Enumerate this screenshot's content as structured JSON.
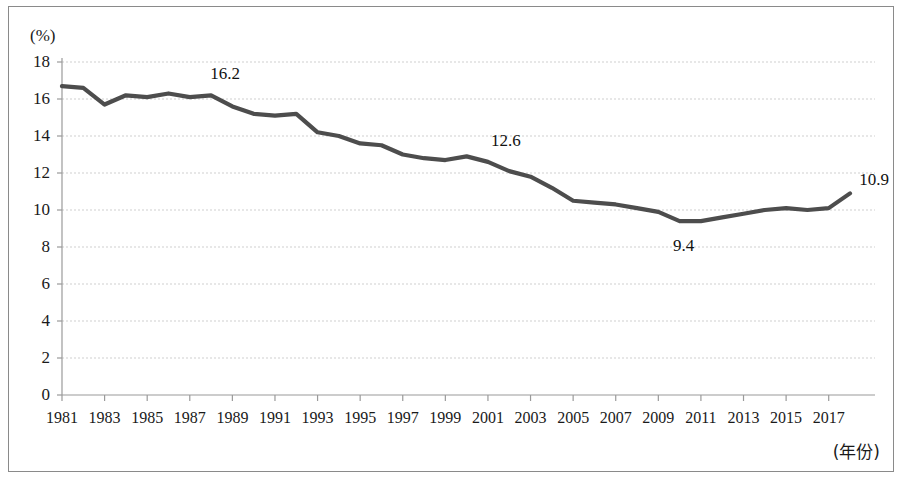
{
  "chart_data": {
    "type": "line",
    "title": "",
    "subtitle": "",
    "xlabel": "(年份)",
    "ylabel": "(%)",
    "ylim": [
      0,
      18
    ],
    "xlim": [
      1981,
      2018
    ],
    "grid": true,
    "legend": false,
    "line_color": "#4d4d4d",
    "x": [
      1981,
      1982,
      1983,
      1984,
      1985,
      1986,
      1987,
      1988,
      1989,
      1990,
      1991,
      1992,
      1993,
      1994,
      1995,
      1996,
      1997,
      1998,
      1999,
      2000,
      2001,
      2002,
      2003,
      2004,
      2005,
      2006,
      2007,
      2008,
      2009,
      2010,
      2011,
      2012,
      2013,
      2014,
      2015,
      2016,
      2017,
      2018
    ],
    "values": [
      16.7,
      16.6,
      15.7,
      16.2,
      16.1,
      16.3,
      16.1,
      16.2,
      15.6,
      15.2,
      15.1,
      15.2,
      14.2,
      14.0,
      13.6,
      13.5,
      13.0,
      12.8,
      12.7,
      12.9,
      12.6,
      12.1,
      11.8,
      11.2,
      10.5,
      10.4,
      10.3,
      10.1,
      9.9,
      9.4,
      9.4,
      9.6,
      9.8,
      10.0,
      10.1,
      10.0,
      10.1,
      10.9
    ],
    "yticks": [
      0,
      2,
      4,
      6,
      8,
      10,
      12,
      14,
      16,
      18
    ],
    "xticks": [
      1981,
      1983,
      1985,
      1987,
      1989,
      1991,
      1993,
      1995,
      1997,
      1999,
      2001,
      2003,
      2005,
      2007,
      2009,
      2011,
      2013,
      2015,
      2017
    ],
    "annotations": [
      {
        "label": "16.2",
        "year": 1988,
        "value": 16.2,
        "dx": 14,
        "dy": -22
      },
      {
        "label": "12.6",
        "year": 2001,
        "value": 12.6,
        "dx": 18,
        "dy": -22
      },
      {
        "label": "9.4",
        "year": 2010,
        "value": 9.4,
        "dx": 4,
        "dy": 24
      },
      {
        "label": "10.9",
        "year": 2018,
        "value": 10.9,
        "dx": 24,
        "dy": -14
      }
    ]
  }
}
